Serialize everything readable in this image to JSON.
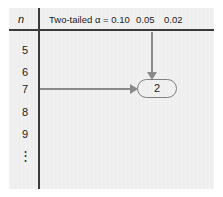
{
  "figure": {
    "type": "statistical-table-lookup-diagram",
    "background_color": "#eeeeee",
    "page_color": "#ffffff",
    "rule_color": "#3a3a3a",
    "arrow_color": "#8a8a8a",
    "highlight_color": "#7f7f7f",
    "text_color": "#1c1c1c"
  },
  "table": {
    "row_header_label": "n",
    "column_headers": [
      {
        "label": "Two-tailed α = 0.10",
        "value": "0.10"
      },
      {
        "label": "0.05",
        "value": "0.05"
      },
      {
        "label": "0.02",
        "value": "0.02"
      }
    ],
    "row_labels": [
      {
        "label": "5"
      },
      {
        "label": "6"
      },
      {
        "label": "7"
      },
      {
        "label": "8"
      },
      {
        "label": "9"
      },
      {
        "label": "⋮"
      }
    ]
  },
  "lookup": {
    "row_value": "7",
    "column_value": "0.05",
    "critical_value": "2",
    "row_arrow_direction": "right",
    "column_arrow_direction": "down"
  }
}
